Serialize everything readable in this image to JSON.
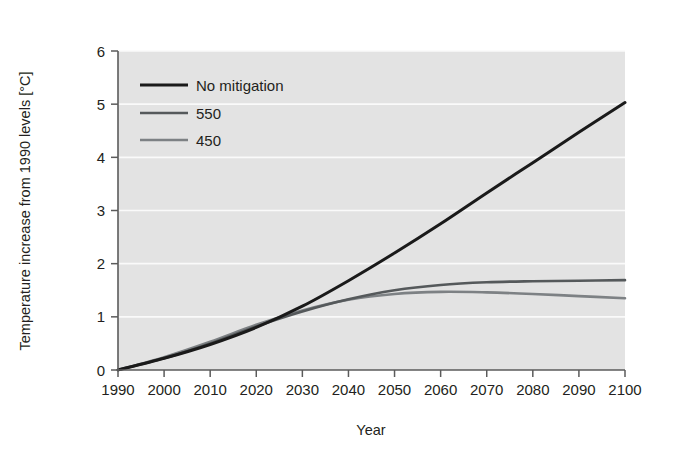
{
  "chart_data": {
    "type": "line",
    "title": "",
    "subtitle": "",
    "xlabel": "Year",
    "ylabel": "Temperature increase from 1990 levels [°C]",
    "xlim": [
      1990,
      2100
    ],
    "ylim": [
      0,
      6
    ],
    "xticks": [
      1990,
      2000,
      2010,
      2020,
      2030,
      2040,
      2050,
      2060,
      2070,
      2080,
      2090,
      2100
    ],
    "yticks": [
      0,
      1,
      2,
      3,
      4,
      5,
      6
    ],
    "xtick_labels": [
      "1990",
      "2000",
      "2010",
      "2020",
      "2030",
      "2040",
      "2050",
      "2060",
      "2070",
      "2080",
      "2090",
      "2100"
    ],
    "ytick_labels": [
      "0",
      "1",
      "2",
      "3",
      "4",
      "5",
      "6"
    ],
    "grid": "horizontal",
    "plot_background": "#e3e3e3",
    "legend_position": "top-left",
    "x": [
      1990,
      2000,
      2010,
      2020,
      2030,
      2040,
      2050,
      2060,
      2070,
      2080,
      2090,
      2100
    ],
    "series": [
      {
        "name": "No mitigation",
        "color": "#1a1a1a",
        "width": 3.0,
        "values": [
          0.0,
          0.22,
          0.48,
          0.8,
          1.2,
          1.68,
          2.2,
          2.75,
          3.33,
          3.9,
          4.47,
          5.03
        ]
      },
      {
        "name": "550",
        "color": "#55595b",
        "width": 2.6,
        "values": [
          0.0,
          0.22,
          0.5,
          0.82,
          1.1,
          1.33,
          1.5,
          1.6,
          1.65,
          1.67,
          1.68,
          1.69
        ]
      },
      {
        "name": "450",
        "color": "#7d8184",
        "width": 2.6,
        "values": [
          0.0,
          0.24,
          0.53,
          0.85,
          1.12,
          1.32,
          1.43,
          1.47,
          1.46,
          1.43,
          1.39,
          1.35
        ]
      }
    ]
  },
  "legend": {
    "entries": [
      {
        "label": "No mitigation",
        "color": "#1a1a1a",
        "width": 3.0
      },
      {
        "label": "550",
        "color": "#55595b",
        "width": 2.6
      },
      {
        "label": "450",
        "color": "#7d8184",
        "width": 2.6
      }
    ]
  },
  "axes": {
    "x_title": "Year",
    "y_title": "Temperature increase from 1990 levels [°C]"
  },
  "geometry": {
    "plot_left": 118,
    "plot_right": 625,
    "plot_top": 51,
    "plot_bottom": 370,
    "legend_swatch_x1": 140,
    "legend_swatch_x2": 188,
    "legend_text_x": 196,
    "legend_rows_y": [
      85,
      113,
      140
    ]
  }
}
